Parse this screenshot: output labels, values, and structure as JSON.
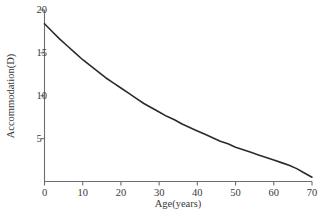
{
  "chart_data": {
    "type": "line",
    "title": "",
    "xlabel": "Age(years)",
    "ylabel": "Accommodation(D)",
    "xlim": [
      0,
      70
    ],
    "ylim": [
      0,
      20
    ],
    "grid": false,
    "legend": null,
    "line_color": "#2b2b2b",
    "axis_color": "#6e6e6e",
    "background_color": "#ffffff",
    "xticks": [
      "0",
      "10",
      "20",
      "30",
      "40",
      "50",
      "60",
      "70"
    ],
    "xtick_values": [
      0,
      10,
      20,
      30,
      40,
      50,
      60,
      70
    ],
    "yticks": [
      "5",
      "10",
      "15",
      "20"
    ],
    "ytick_values": [
      5,
      10,
      15,
      20
    ],
    "series": [
      {
        "name": "Accommodation amplitude",
        "x": [
          0,
          2,
          4,
          6,
          8,
          10,
          12,
          14,
          16,
          18,
          20,
          22,
          24,
          26,
          28,
          30,
          32,
          34,
          36,
          38,
          40,
          42,
          44,
          46,
          48,
          50,
          52,
          54,
          56,
          58,
          60,
          62,
          64,
          66,
          68,
          70
        ],
        "y": [
          18.4,
          17.5,
          16.6,
          15.8,
          15.0,
          14.2,
          13.5,
          12.8,
          12.1,
          11.5,
          10.9,
          10.3,
          9.7,
          9.1,
          8.6,
          8.1,
          7.6,
          7.2,
          6.7,
          6.3,
          5.9,
          5.5,
          5.1,
          4.7,
          4.4,
          4.0,
          3.7,
          3.4,
          3.1,
          2.8,
          2.5,
          2.2,
          1.9,
          1.5,
          1.0,
          0.5
        ]
      }
    ]
  }
}
